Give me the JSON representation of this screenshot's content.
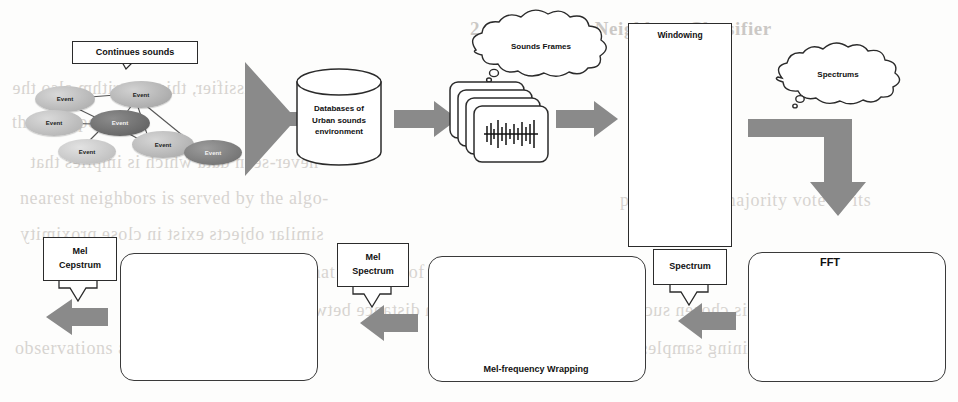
{
  "figure": {
    "background_color": "#fdfdfc",
    "arrow_color": "#8a8a8a",
    "line_color": "#2b2b2b",
    "ellipse_light": "#bdbdbd",
    "ellipse_dark": "#6f6f6f"
  },
  "stage_continues_sounds": {
    "callout_label": "Continues sounds",
    "nodes": [
      {
        "label": "Event",
        "tone": "light"
      },
      {
        "label": "Event",
        "tone": "light"
      },
      {
        "label": "Event",
        "tone": "light"
      },
      {
        "label": "Event",
        "tone": "dark"
      },
      {
        "label": "Event",
        "tone": "light"
      },
      {
        "label": "Event",
        "tone": "light"
      },
      {
        "label": "Event",
        "tone": "dark"
      }
    ]
  },
  "stage_database": {
    "line1": "Databases of",
    "line2": "Urban sounds",
    "line3": "environment"
  },
  "stage_sounds_frames": {
    "cloud_label": "Sounds Frames"
  },
  "stage_windowing": {
    "title": "Windowing",
    "frames": [
      {
        "label": "Frame1"
      },
      {
        "label": "Frame2"
      },
      {
        "label": "Frame3"
      },
      {
        "label": "Frame4"
      }
    ],
    "ellipsis": "⋮"
  },
  "stage_spectrums": {
    "cloud_label": "Spectrums"
  },
  "stage_fft": {
    "title": "FFT",
    "y_axis_label": "amplitude",
    "frequency_label": "frequency",
    "time_label": "time",
    "left_caption_line1": "Time domain",
    "left_caption_line2": "amplitude vs. time",
    "right_caption_line1": "Frequency Domain",
    "right_caption_line2": "amplitude vs. frequency"
  },
  "stage_spectrum_callout": {
    "label": "Spectrum"
  },
  "stage_mel_wrapping": {
    "title": "Mel-frequency Wrapping",
    "axis_label": "f mel"
  },
  "stage_mel_spectrum_callout": {
    "line1": "Mel",
    "line2": "Spectrum"
  },
  "stage_cepstrum_plot": {
    "description": "Mel cepstrum waveform plot"
  },
  "stage_mel_cepstrum_callout": {
    "line1": "Mel",
    "line2": "Cepstrum"
  },
  "bleed_text": {
    "l1": "2.4   K-Nearest Neighbors Classifier",
    "l2": "classifier, this algorithm also the",
    "l3": "the data points in",
    "l4": "never-seen data which is implies that",
    "l5": "nearest neighbors is served by the algo-",
    "l6": "similar objects exist in close proximity",
    "l7": "with the idea that the kind of instances",
    "l8": "Euclidean distance between two points",
    "l9": "observations and the distance of each",
    "l10": "the value of K is chosen such that",
    "l11": "predicted by majority vote of its",
    "l12": "in given training samples"
  }
}
